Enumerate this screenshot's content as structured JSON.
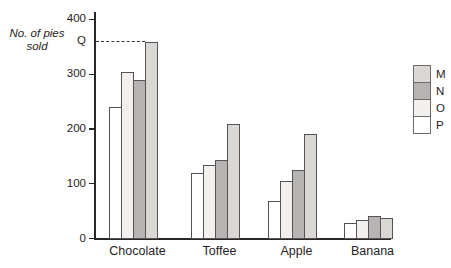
{
  "labels": {
    "y_axis_line1": "No. of pies",
    "y_axis_line2": "sold"
  },
  "chart_data": {
    "type": "bar",
    "title": "",
    "xlabel": "",
    "ylabel": "No. of pies sold",
    "categories": [
      "Chocolate",
      "Toffee",
      "Apple",
      "Banana"
    ],
    "series": [
      {
        "name": "P",
        "color": "#ffffff",
        "values": [
          240,
          120,
          70,
          30
        ]
      },
      {
        "name": "O",
        "color": "#f1f0ec",
        "values": [
          305,
          135,
          105,
          35
        ]
      },
      {
        "name": "N",
        "color": "#b5b4b2",
        "values": [
          290,
          145,
          125,
          42
        ]
      },
      {
        "name": "M",
        "color": "#d9d8d4",
        "values": [
          360,
          210,
          192,
          38
        ]
      }
    ],
    "ylim": [
      0,
      400
    ],
    "yticks": [
      0,
      100,
      200,
      300,
      400
    ],
    "grid": false,
    "legend": {
      "position": "right",
      "order": [
        "M",
        "N",
        "O",
        "P"
      ]
    },
    "annotation": {
      "label": "Q",
      "value": 360,
      "style": "dashed-leader-line",
      "target": "tallest Chocolate bar (series M)"
    },
    "axis_color": "#2a2628",
    "bar_border_color": "#565256"
  }
}
